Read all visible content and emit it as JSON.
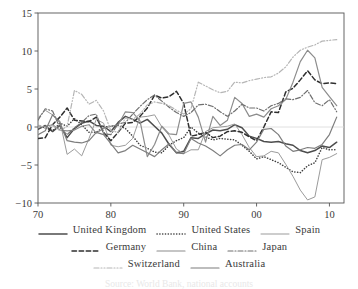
{
  "chart_data": {
    "type": "line",
    "title": "",
    "subtitle": "",
    "xlabel": "",
    "ylabel": "",
    "xlim": [
      1970,
      2012
    ],
    "ylim": [
      -10,
      15
    ],
    "xticks": [
      1970,
      1980,
      1990,
      2000,
      2010
    ],
    "xtick_labels": [
      "70",
      "80",
      "90",
      "00",
      "10"
    ],
    "yticks": [
      -10,
      -5,
      0,
      5,
      10,
      15
    ],
    "ytick_labels": [
      "−10",
      "−5",
      "0",
      "5",
      "10",
      "15"
    ],
    "grid": false,
    "zero_line": true,
    "legend_position": "below",
    "legend_rows": [
      [
        "United Kingdom",
        "United States",
        "Spain"
      ],
      [
        "Germany",
        "China",
        "Japan"
      ],
      [
        "Switzerland",
        "Australia"
      ]
    ],
    "series": [
      {
        "name": "United Kingdom",
        "style": "solid",
        "color": "#4d4d4d",
        "width": 1.5,
        "x": [
          1970,
          1971,
          1972,
          1973,
          1974,
          1975,
          1976,
          1977,
          1978,
          1979,
          1980,
          1981,
          1982,
          1983,
          1984,
          1985,
          1986,
          1987,
          1988,
          1989,
          1990,
          1991,
          1992,
          1993,
          1994,
          1995,
          1996,
          1997,
          1998,
          1999,
          2000,
          2001,
          2002,
          2003,
          2004,
          2005,
          2006,
          2007,
          2008,
          2009,
          2010,
          2011
        ],
        "values": [
          -0.3,
          0.2,
          -0.6,
          0.2,
          -1.4,
          -0.2,
          0.5,
          0.8,
          0.2,
          0.1,
          -0.6,
          0.6,
          1.4,
          1.0,
          0.5,
          1.0,
          0.1,
          -0.8,
          -2.3,
          -3.4,
          -3.2,
          -1.4,
          -1.5,
          -0.9,
          -0.4,
          -0.5,
          -0.3,
          0.3,
          -0.1,
          -1.2,
          -1.5,
          -1.9,
          -2.0,
          -1.9,
          -2.2,
          -2.4,
          -3.1,
          -3.4,
          -3.1,
          -2.5,
          -2.7,
          -2.0
        ]
      },
      {
        "name": "United States",
        "style": "dotted",
        "color": "#3f3f3f",
        "width": 1.5,
        "x": [
          1970,
          1971,
          1972,
          1973,
          1974,
          1975,
          1976,
          1977,
          1978,
          1979,
          1980,
          1981,
          1982,
          1983,
          1984,
          1985,
          1986,
          1987,
          1988,
          1989,
          1990,
          1991,
          1992,
          1993,
          1994,
          1995,
          1996,
          1997,
          1998,
          1999,
          2000,
          2001,
          2002,
          2003,
          2004,
          2005,
          2006,
          2007,
          2008,
          2009,
          2010,
          2011
        ],
        "values": [
          0.2,
          -0.1,
          -0.5,
          0.5,
          0.1,
          1.1,
          0.3,
          -0.7,
          -0.7,
          0.0,
          0.1,
          0.2,
          -0.2,
          -1.2,
          -2.4,
          -2.8,
          -3.3,
          -3.4,
          -2.4,
          -1.8,
          -1.4,
          0.0,
          -0.8,
          -1.3,
          -1.7,
          -1.5,
          -1.6,
          -1.7,
          -2.4,
          -3.2,
          -4.2,
          -3.9,
          -4.3,
          -4.7,
          -5.3,
          -5.9,
          -6.0,
          -5.1,
          -4.7,
          -2.7,
          -3.0,
          -3.0
        ]
      },
      {
        "name": "Spain",
        "style": "solid",
        "color": "#9b9b9b",
        "width": 1.0,
        "x": [
          1970,
          1971,
          1972,
          1973,
          1974,
          1975,
          1976,
          1977,
          1978,
          1979,
          1980,
          1981,
          1982,
          1983,
          1984,
          1985,
          1986,
          1987,
          1988,
          1989,
          1990,
          1991,
          1992,
          1993,
          1994,
          1995,
          1996,
          1997,
          1998,
          1999,
          2000,
          2001,
          2002,
          2003,
          2004,
          2005,
          2006,
          2007,
          2008,
          2009,
          2010,
          2011
        ],
        "values": [
          1.2,
          2.2,
          1.6,
          0.8,
          -3.6,
          -2.9,
          -3.8,
          -1.5,
          1.0,
          0.5,
          -2.4,
          -2.6,
          -2.4,
          -1.5,
          1.3,
          1.4,
          1.6,
          0.0,
          -1.1,
          -2.9,
          -3.5,
          -3.0,
          -3.0,
          -0.6,
          -0.1,
          0.0,
          0.1,
          0.4,
          -1.0,
          -2.7,
          -3.9,
          -3.8,
          -3.2,
          -3.4,
          -4.9,
          -6.5,
          -8.3,
          -9.6,
          -9.2,
          -4.3,
          -4.0,
          -3.5
        ]
      },
      {
        "name": "Germany",
        "style": "dashed",
        "color": "#2f2f2f",
        "width": 1.5,
        "x": [
          1970,
          1971,
          1972,
          1973,
          1974,
          1975,
          1976,
          1977,
          1978,
          1979,
          1980,
          1981,
          1982,
          1983,
          1984,
          1985,
          1986,
          1987,
          1988,
          1989,
          1990,
          1991,
          1992,
          1993,
          1994,
          1995,
          1996,
          1997,
          1998,
          1999,
          2000,
          2001,
          2002,
          2003,
          2004,
          2005,
          2006,
          2007,
          2008,
          2009,
          2010,
          2011
        ],
        "values": [
          -1.5,
          -1.4,
          0.3,
          1.3,
          2.5,
          0.9,
          0.8,
          0.7,
          1.3,
          -0.7,
          -1.8,
          -0.7,
          0.5,
          0.6,
          1.4,
          2.5,
          4.2,
          3.8,
          4.0,
          4.7,
          3.1,
          -1.2,
          -1.0,
          -0.7,
          -1.4,
          -1.2,
          -0.6,
          -0.5,
          -0.7,
          -1.3,
          -1.8,
          0.0,
          2.0,
          1.9,
          4.6,
          5.1,
          6.2,
          7.4,
          6.2,
          5.7,
          5.8,
          5.7
        ]
      },
      {
        "name": "China",
        "style": "solid",
        "color": "#8c8c8c",
        "width": 1.2,
        "x": [
          1970,
          1971,
          1972,
          1973,
          1974,
          1975,
          1976,
          1977,
          1978,
          1979,
          1980,
          1981,
          1982,
          1983,
          1984,
          1985,
          1986,
          1987,
          1988,
          1989,
          1990,
          1991,
          1992,
          1993,
          1994,
          1995,
          1996,
          1997,
          1998,
          1999,
          2000,
          2001,
          2002,
          2003,
          2004,
          2005,
          2006,
          2007,
          2008,
          2009,
          2010,
          2011
        ],
        "values": [
          0.0,
          0.1,
          0.3,
          -0.4,
          -0.5,
          -0.4,
          0.1,
          0.3,
          -0.8,
          -0.2,
          0.1,
          0.3,
          2.0,
          1.9,
          0.8,
          -3.9,
          -2.3,
          0.1,
          -0.9,
          -1.0,
          3.1,
          3.3,
          1.3,
          -2.0,
          1.4,
          0.2,
          0.9,
          3.9,
          3.1,
          1.4,
          1.7,
          1.3,
          2.4,
          2.8,
          3.6,
          5.9,
          8.6,
          10.1,
          9.1,
          5.2,
          4.0,
          2.8
        ]
      },
      {
        "name": "Japan",
        "style": "dashdot",
        "color": "#6f6f6f",
        "width": 1.2,
        "x": [
          1970,
          1971,
          1972,
          1973,
          1974,
          1975,
          1976,
          1977,
          1978,
          1979,
          1980,
          1981,
          1982,
          1983,
          1984,
          1985,
          1986,
          1987,
          1988,
          1989,
          1990,
          1991,
          1992,
          1993,
          1994,
          1995,
          1996,
          1997,
          1998,
          1999,
          2000,
          2001,
          2002,
          2003,
          2004,
          2005,
          2006,
          2007,
          2008,
          2009,
          2010,
          2011
        ],
        "values": [
          0.9,
          2.4,
          2.1,
          -0.1,
          -1.0,
          -0.1,
          0.6,
          1.5,
          1.7,
          -0.9,
          -1.0,
          0.4,
          0.6,
          1.7,
          2.7,
          3.6,
          4.2,
          3.4,
          2.6,
          1.9,
          1.4,
          1.9,
          2.9,
          3.0,
          2.7,
          2.0,
          1.4,
          2.1,
          3.0,
          2.5,
          2.5,
          2.1,
          2.8,
          3.1,
          3.7,
          3.6,
          3.9,
          4.8,
          3.2,
          2.8,
          3.6,
          2.0
        ]
      },
      {
        "name": "Switzerland",
        "style": "dashdotdot",
        "color": "#b5b5b5",
        "width": 1.2,
        "x": [
          1970,
          1971,
          1972,
          1973,
          1974,
          1975,
          1976,
          1977,
          1978,
          1979,
          1980,
          1981,
          1982,
          1983,
          1984,
          1985,
          1986,
          1987,
          1988,
          1989,
          1990,
          1991,
          1992,
          1993,
          1994,
          1995,
          1996,
          1997,
          1998,
          1999,
          2000,
          2001,
          2002,
          2003,
          2004,
          2005,
          2006,
          2007,
          2008,
          2009,
          2010,
          2011
        ],
        "values": [
          0.3,
          -0.2,
          0.2,
          -0.5,
          0.1,
          4.8,
          4.3,
          3.0,
          3.5,
          2.1,
          -0.5,
          -0.7,
          1.2,
          1.0,
          1.7,
          2.9,
          3.3,
          3.1,
          2.8,
          2.2,
          1.7,
          2.4,
          5.9,
          5.4,
          4.9,
          4.5,
          4.7,
          5.9,
          5.8,
          6.1,
          6.3,
          6.5,
          6.6,
          7.1,
          7.9,
          9.2,
          10.1,
          10.5,
          10.8,
          11.3,
          11.4,
          11.5
        ]
      },
      {
        "name": "Australia",
        "style": "solid",
        "color": "#7d7d7d",
        "width": 1.2,
        "x": [
          1970,
          1971,
          1972,
          1973,
          1974,
          1975,
          1976,
          1977,
          1978,
          1979,
          1980,
          1981,
          1982,
          1983,
          1984,
          1985,
          1986,
          1987,
          1988,
          1989,
          1990,
          1991,
          1992,
          1993,
          1994,
          1995,
          1996,
          1997,
          1998,
          1999,
          2000,
          2001,
          2002,
          2003,
          2004,
          2005,
          2006,
          2007,
          2008,
          2009,
          2010,
          2011
        ],
        "values": [
          -1.0,
          -0.5,
          1.6,
          0.6,
          -1.8,
          -2.0,
          -2.1,
          -1.8,
          -0.7,
          -1.0,
          -2.2,
          -3.4,
          -3.1,
          -2.4,
          -2.9,
          -3.4,
          -3.9,
          -3.0,
          -2.2,
          -3.4,
          -3.5,
          -1.5,
          -2.1,
          -2.5,
          -3.1,
          -3.8,
          -3.0,
          -2.4,
          -2.3,
          -3.0,
          -2.0,
          -0.3,
          -0.2,
          -1.0,
          -2.5,
          -3.2,
          -3.0,
          -2.7,
          -2.8,
          -2.3,
          -1.0,
          1.3
        ]
      }
    ]
  },
  "axes": {
    "y_top_label": "15",
    "y_bottom_label": "−10"
  },
  "footnote": {
    "text": "Source: World Bank, national accounts"
  }
}
